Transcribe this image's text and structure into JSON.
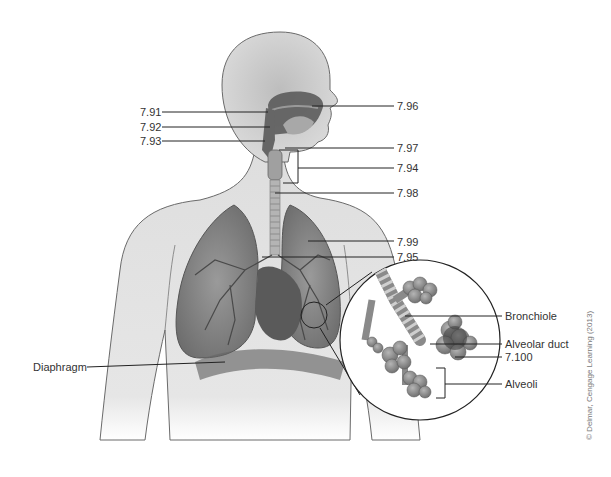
{
  "figure": {
    "labels_left": [
      {
        "id": "7.91",
        "text": "7.91",
        "x": 140,
        "y": 106,
        "line": [
          162,
          112,
          268,
          112
        ]
      },
      {
        "id": "7.92",
        "text": "7.92",
        "x": 140,
        "y": 121,
        "line": [
          162,
          127,
          270,
          127
        ]
      },
      {
        "id": "7.93",
        "text": "7.93",
        "x": 140,
        "y": 135,
        "line": [
          162,
          141,
          265,
          141
        ]
      },
      {
        "id": "diaphragm",
        "text": "Diaphragm",
        "x": 33,
        "y": 361,
        "line": [
          87,
          367,
          225,
          362
        ]
      }
    ],
    "labels_right": [
      {
        "id": "7.96",
        "text": "7.96",
        "x": 397,
        "y": 100,
        "line": [
          312,
          106,
          394,
          106
        ]
      },
      {
        "id": "7.97",
        "text": "7.97",
        "x": 397,
        "y": 142,
        "line": [
          285,
          148,
          394,
          148
        ]
      },
      {
        "id": "7.94",
        "text": "7.94",
        "x": 397,
        "y": 162,
        "line": [
          298,
          168,
          394,
          168
        ]
      },
      {
        "id": "7.98",
        "text": "7.98",
        "x": 397,
        "y": 187,
        "line": [
          275,
          193,
          394,
          193
        ]
      },
      {
        "id": "7.99",
        "text": "7.99",
        "x": 397,
        "y": 236,
        "line": [
          308,
          241,
          394,
          241
        ]
      },
      {
        "id": "7.95",
        "text": "7.95",
        "x": 397,
        "y": 253,
        "line": [
          262,
          257,
          394,
          257
        ]
      },
      {
        "id": "bronchiole",
        "text": "Bronchiole",
        "x": 505,
        "y": 310,
        "line": [
          405,
          316,
          502,
          316
        ]
      },
      {
        "id": "alveolar-duct",
        "text": "Alveolar duct",
        "x": 505,
        "y": 338,
        "line": [
          430,
          344,
          502,
          344
        ]
      },
      {
        "id": "7.100",
        "text": "7.100",
        "x": 505,
        "y": 351,
        "line": [
          455,
          357,
          502,
          357
        ]
      },
      {
        "id": "alveoli",
        "text": "Alveoli",
        "x": 505,
        "y": 378,
        "line": [
          444,
          384,
          502,
          384
        ]
      }
    ],
    "credit": "© Delmar, Cengage Learning (2013)",
    "colors": {
      "skin": "#e4e4e4",
      "skin_shadow": "#c8c8c8",
      "outline": "#6a6a6a",
      "lung": "#8a8a8a",
      "lung_dark": "#5a5a5a",
      "airway": "#7a7a7a",
      "heart": "#555555",
      "leader_line": "#222222",
      "label_text": "#333333"
    }
  }
}
